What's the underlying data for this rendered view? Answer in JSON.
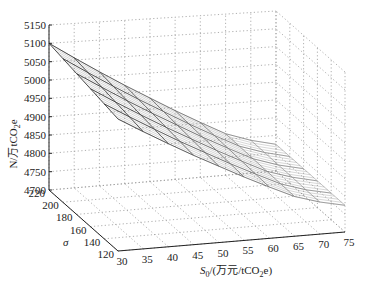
{
  "chart_data": {
    "type": "surface3d",
    "title": "",
    "xlabel": "S0/(万元/tCO2e)",
    "xlabel_parts": {
      "main": "S",
      "sub": "0",
      "rest": "/(万元/tCO",
      "sub2": "2",
      "end": "e)"
    },
    "ylabel": "σ",
    "zlabel": "N/万tCO2e",
    "zlabel_parts": {
      "main": "N/万tCO",
      "sub": "2",
      "end": "e"
    },
    "x_ticks": [
      30,
      35,
      40,
      45,
      50,
      55,
      60,
      65,
      70,
      75
    ],
    "y_ticks": [
      120,
      140,
      160,
      180,
      200,
      220
    ],
    "z_ticks": [
      4700,
      4750,
      4800,
      4850,
      4900,
      4950,
      5000,
      5050,
      5100,
      5150
    ],
    "xlim": [
      30,
      75
    ],
    "ylim": [
      120,
      220
    ],
    "zlim": [
      4700,
      5150
    ],
    "grid": true,
    "x": [
      30,
      35,
      40,
      45,
      50,
      55,
      60,
      65,
      70,
      75
    ],
    "y": [
      120,
      140,
      160,
      180,
      200,
      220
    ],
    "z": [
      [
        5060,
        5021,
        4983,
        4946,
        4911,
        4876,
        4843,
        4811,
        4790,
        4775
      ],
      [
        5068,
        5028,
        4989,
        4951,
        4915,
        4879,
        4845,
        4812,
        4790,
        4775
      ],
      [
        5076,
        5035,
        4995,
        4956,
        4919,
        4882,
        4847,
        4813,
        4791,
        4775
      ],
      [
        5084,
        5042,
        5001,
        4961,
        4923,
        4885,
        4849,
        4814,
        4791,
        4775
      ],
      [
        5092,
        5049,
        5007,
        4966,
        4927,
        4888,
        4851,
        4815,
        4792,
        4775
      ],
      [
        5100,
        5056,
        5013,
        4971,
        4931,
        4891,
        4853,
        4816,
        4792,
        4775
      ]
    ],
    "colormap": "gray",
    "view": "matlab-3d"
  }
}
